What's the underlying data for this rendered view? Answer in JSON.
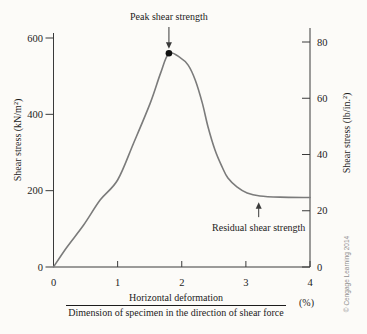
{
  "figure": {
    "bg": "#fcfbf8",
    "curve_color": "#7b7b7b",
    "axis_color": "#3a3a3a",
    "text_color": "#1c1c1c",
    "marker_color": "#111111",
    "copyright": "© Cengage Learning 2014",
    "copyright_color": "#919191"
  },
  "chart_data": {
    "type": "line",
    "title": "",
    "x_axis": {
      "label_numerator": "Horizontal deformation",
      "label_denominator": "Dimension of specimen in the direction of shear force",
      "unit": "(%)",
      "ticks": [
        0,
        1,
        2,
        3,
        4
      ],
      "range": [
        0,
        4
      ]
    },
    "y_axis_left": {
      "label": "Shear stress (kN/m²)",
      "ticks": [
        0,
        200,
        400,
        600
      ],
      "range": [
        0,
        600
      ]
    },
    "y_axis_right": {
      "label": "Shear stress (lb/in.²)",
      "ticks": [
        0,
        20,
        40,
        60,
        80
      ],
      "range": [
        0,
        80
      ]
    },
    "grid": false,
    "legend": false,
    "series": [
      {
        "name": "Shear stress vs. horizontal deformation (dense specimen)",
        "points": [
          [
            0,
            0
          ],
          [
            0.2,
            50
          ],
          [
            0.47,
            110
          ],
          [
            0.73,
            176
          ],
          [
            1.0,
            228
          ],
          [
            1.25,
            325
          ],
          [
            1.51,
            430
          ],
          [
            1.67,
            508
          ],
          [
            1.8,
            560
          ],
          [
            1.98,
            548
          ],
          [
            2.1,
            529
          ],
          [
            2.21,
            490
          ],
          [
            2.32,
            430
          ],
          [
            2.41,
            367
          ],
          [
            2.52,
            306
          ],
          [
            2.63,
            262
          ],
          [
            2.72,
            233
          ],
          [
            2.86,
            210
          ],
          [
            3.02,
            194
          ],
          [
            3.22,
            186
          ],
          [
            3.53,
            183
          ],
          [
            4.0,
            182
          ]
        ]
      }
    ],
    "annotations": [
      {
        "text": "Peak shear strength",
        "x": 1.8,
        "y": 560,
        "direction": "down"
      },
      {
        "text": "Residual shear strength",
        "x": 3.2,
        "y": 183,
        "direction": "up"
      }
    ]
  }
}
